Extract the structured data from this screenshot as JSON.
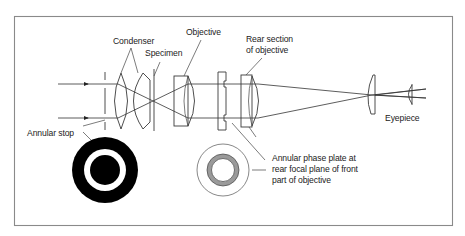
{
  "diagram": {
    "labels": {
      "condenser": "Condenser",
      "specimen": "Specimen",
      "objective": "Objective",
      "rear_section_line1": "Rear section",
      "rear_section_line2": "of objective",
      "eyepiece": "Eyepiece",
      "annular_stop": "Annular stop",
      "phase_plate_line1": "Annular phase plate at",
      "phase_plate_line2": "rear focal plane of front",
      "phase_plate_line3": "part of objective"
    },
    "colors": {
      "frame": "#8a8a8a",
      "line": "#3a3a3a",
      "stop_fill": "#000000",
      "phase_ring": "#9a9a9a",
      "background": "#ffffff"
    }
  }
}
